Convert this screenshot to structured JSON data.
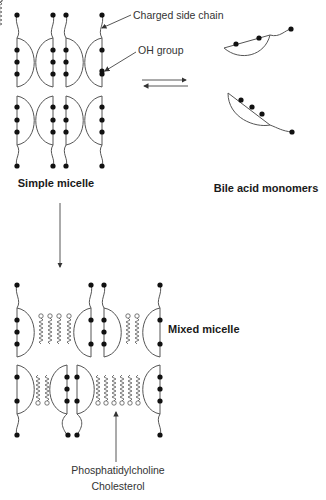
{
  "figure": {
    "labels": {
      "charged_side_chain": "Charged side chain",
      "oh_group": "OH group",
      "simple_micelle": "Simple micelle",
      "bile_acid_monomers": "Bile acid monomers",
      "mixed_micelle": "Mixed micelle",
      "phosphatidylcholine": "Phosphatidylcholine",
      "cholesterol": "Cholesterol"
    },
    "arrows": {
      "equilibrium": "simple micelle ⇌ bile acid monomers",
      "transition": "simple micelle → mixed micelle",
      "pointer": "points to phosphatidylcholine/cholesterol chains"
    },
    "colors": {
      "line": "#555555",
      "dot": "#111111",
      "text": "#333333"
    }
  }
}
